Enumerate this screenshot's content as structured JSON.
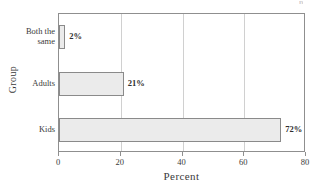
{
  "chart_data": {
    "type": "bar",
    "orientation": "horizontal",
    "title": "",
    "xlabel": "Percent",
    "ylabel": "Group",
    "categories": [
      "Both the\nsame",
      "Adults",
      "Kids"
    ],
    "values": [
      2,
      21,
      72
    ],
    "value_labels": [
      "2%",
      "21%",
      "72%"
    ],
    "xlim": [
      0,
      80
    ],
    "xticks": [
      0,
      20,
      40,
      60,
      80
    ],
    "xtick_labels": [
      "0",
      "20",
      "40",
      "60",
      "80"
    ],
    "grid": "vertical",
    "legend": null,
    "bar_fill_color": "#ebebeb",
    "bar_border_color": "#8a8a8a",
    "grid_color": "#d0d0d0",
    "frame_color": "#8f8f8f",
    "text_color": "#3a3a3a"
  },
  "title_remnant": "p"
}
